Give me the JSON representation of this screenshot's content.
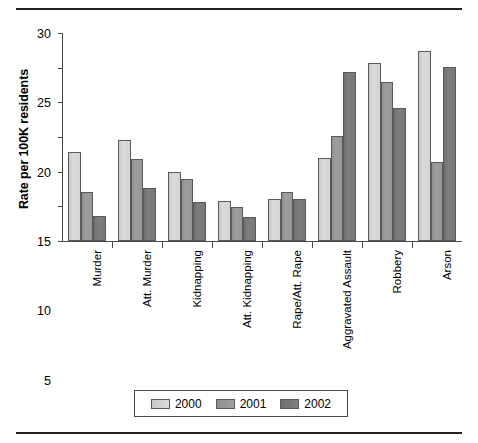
{
  "rules": {
    "top_rule": "horizontal-rule",
    "bottom_rule": "horizontal-rule"
  },
  "chart_data": {
    "type": "bar",
    "title": "",
    "xlabel": "",
    "ylabel": "Rate per 100K residents",
    "ylim": [
      0,
      30
    ],
    "yticks": [
      0,
      5,
      10,
      15,
      20,
      25,
      30
    ],
    "ytick_labels": [
      "0",
      "5",
      "10",
      "15",
      "20",
      "25",
      "30"
    ],
    "grid": false,
    "legend_position": "bottom",
    "categories": [
      "Murder",
      "Att. Murder",
      "Kidnapping",
      "Att. Kidnapping",
      "Rape/Att. Rape",
      "Aggravated Assault",
      "Robbery",
      "Arson"
    ],
    "series": [
      {
        "name": "2000",
        "color": "#d8d8d8",
        "values": [
          12.8,
          14.6,
          10.0,
          5.8,
          6.1,
          12.0,
          25.7,
          27.4
        ]
      },
      {
        "name": "2001",
        "color": "#999999",
        "values": [
          7.1,
          11.9,
          8.9,
          4.9,
          7.0,
          15.2,
          23.0,
          11.4
        ]
      },
      {
        "name": "2002",
        "color": "#777777",
        "values": [
          3.6,
          7.6,
          5.6,
          3.4,
          6.1,
          24.4,
          19.2,
          25.1
        ]
      }
    ]
  },
  "legend": {
    "items": [
      {
        "label": "2000"
      },
      {
        "label": "2001"
      },
      {
        "label": "2002"
      }
    ]
  }
}
